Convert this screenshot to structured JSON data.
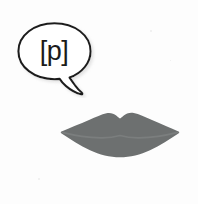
{
  "figure": {
    "background_color": "#fdfdfd"
  },
  "speech_bubble": {
    "name": "speech-bubble",
    "text": "[p]",
    "phonetic_symbol": "p",
    "bracket_open": "[",
    "bracket_close": "]",
    "outline_color": "#1f1f1f",
    "fill_color": "#ffffff",
    "text_color": "#1b1b1b",
    "shadow_color": "#bdbdbd",
    "tail_direction": "down-right"
  },
  "lips": {
    "name": "lips-closed",
    "state": "closed",
    "fill_color": "#6d7070",
    "seam_color": "#7b7e7e",
    "description": "closed lips pressed together"
  },
  "icons": {
    "speech_bubble_icon": "speech-bubble-icon",
    "lips_icon": "lips-icon"
  }
}
